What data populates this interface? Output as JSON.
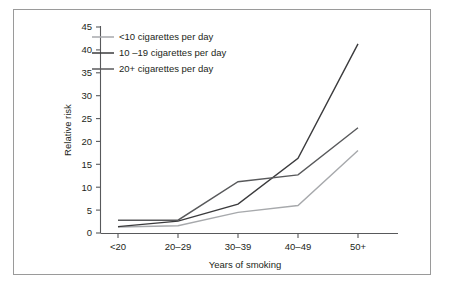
{
  "figure": {
    "background_color": "#ffffff",
    "frame_color": "#9a9a9a",
    "axis_color": "#58595b",
    "text_color": "#231f20"
  },
  "chart_data": {
    "type": "line",
    "title": "",
    "subtitle": "",
    "xlabel": "Years of smoking",
    "ylabel": "Relative risk",
    "categories": [
      "<20",
      "20–29",
      "30–39",
      "40–49",
      "50+"
    ],
    "ylim": [
      0,
      45
    ],
    "yticks": [
      0,
      5,
      10,
      15,
      20,
      25,
      30,
      35,
      40,
      45
    ],
    "ytick_labels": [
      "0",
      "5",
      "10",
      "15",
      "20",
      "25",
      "30",
      "35",
      "40",
      "45"
    ],
    "grid": false,
    "legend_position": "top-left",
    "annotations": [],
    "series": [
      {
        "name": "<10 cigarettes per day",
        "color": "#a7a9ac",
        "width": 1.4,
        "values": [
          1.3,
          1.6,
          4.5,
          6.0,
          18.0
        ]
      },
      {
        "name": "10 –19 cigarettes per day",
        "color": "#3b3b3d",
        "width": 1.4,
        "values": [
          1.4,
          2.6,
          6.3,
          16.3,
          41.3
        ]
      },
      {
        "name": "20+ cigarettes per day",
        "color": "#58595b",
        "width": 1.4,
        "values": [
          2.8,
          2.8,
          11.2,
          12.7,
          23.0
        ]
      }
    ]
  },
  "legend": {
    "entries": [
      {
        "label": "<10 cigarettes per day",
        "color": "#a7a9ac"
      },
      {
        "label": "10 –19 cigarettes per day",
        "color": "#3b3b3d"
      },
      {
        "label": "20+ cigarettes per day",
        "color": "#58595b"
      }
    ]
  }
}
